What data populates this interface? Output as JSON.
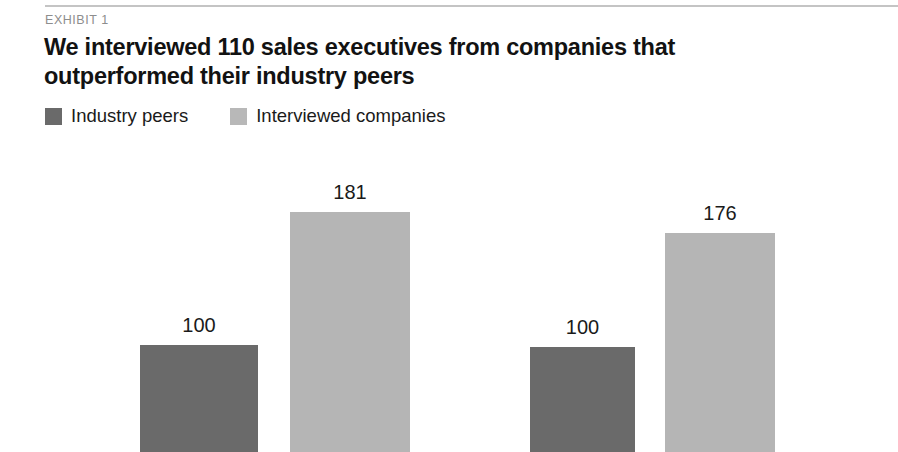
{
  "exhibit": {
    "eyebrow": "EXHIBIT 1",
    "title_line1": "We interviewed 110 sales executives from companies that",
    "title_line2": "outperformed their industry peers"
  },
  "legend": {
    "items": [
      {
        "label": "Industry peers",
        "color": "#6a6a6a",
        "swatch_name": "legend-swatch-industry-peers"
      },
      {
        "label": "Interviewed companies",
        "color": "#b8b8b8",
        "swatch_name": "legend-swatch-interviewed-companies"
      }
    ]
  },
  "chart_data": {
    "type": "bar",
    "title": "We interviewed 110 sales executives from companies that outperformed their industry peers",
    "subtitle": "EXHIBIT 1",
    "xlabel": "",
    "ylabel": "",
    "ylim": [
      0,
      200
    ],
    "grid": false,
    "legend_position": "top-left",
    "categories": [
      "Group 1",
      "Group 2"
    ],
    "series": [
      {
        "name": "Industry peers",
        "color": "#6a6a6a",
        "values": [
          100,
          100
        ]
      },
      {
        "name": "Interviewed companies",
        "color": "#b5b5b5",
        "values": [
          181,
          176
        ]
      }
    ],
    "bars": [
      {
        "label": "100",
        "value": 100,
        "series": "Industry peers",
        "color": "#6a6a6a",
        "left": 140,
        "width": 118,
        "top": 195
      },
      {
        "label": "181",
        "value": 181,
        "series": "Interviewed companies",
        "color": "#b5b5b5",
        "left": 290,
        "width": 120,
        "top": 62
      },
      {
        "label": "100",
        "value": 100,
        "series": "Industry peers",
        "color": "#6a6a6a",
        "left": 530,
        "width": 105,
        "top": 197
      },
      {
        "label": "176",
        "value": 176,
        "series": "Interviewed companies",
        "color": "#b5b5b5",
        "left": 665,
        "width": 110,
        "top": 83
      }
    ]
  }
}
